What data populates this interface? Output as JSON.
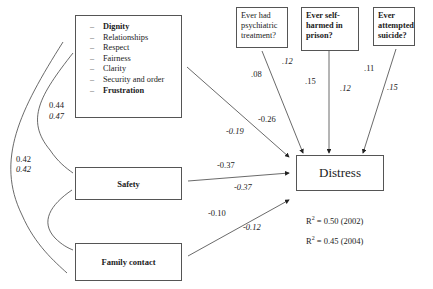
{
  "diagram": {
    "type": "path model",
    "factors_box": {
      "items": [
        {
          "label": "Dignity",
          "bold": true
        },
        {
          "label": "Relationships",
          "bold": false
        },
        {
          "label": "Respect",
          "bold": false
        },
        {
          "label": "Fairness",
          "bold": false
        },
        {
          "label": "Clarity",
          "bold": false
        },
        {
          "label": "Security and order",
          "bold": false
        },
        {
          "label": "Frustration",
          "bold": true
        }
      ],
      "bullet": "–"
    },
    "nodes": {
      "safety": "Safety",
      "family_contact": "Family contact",
      "distress": "Distress"
    },
    "questions": [
      {
        "label": "Ever had psychiatric treatment?",
        "lines": [
          "Ever had",
          "psychiatric",
          "treatment?"
        ]
      },
      {
        "label": "Ever self-harmed in prison?",
        "lines": [
          "Ever self-",
          "harmed in",
          "prison?"
        ]
      },
      {
        "label": "Ever attempted suicide?",
        "lines": [
          "Ever",
          "attempted",
          "suicide?"
        ]
      }
    ],
    "coefficients": {
      "factors_distress": {
        "y2002": "-0.26",
        "y2004": "-0.19"
      },
      "safety_distress": {
        "y2002": "-0.37",
        "y2004": "-0.37"
      },
      "family_distress": {
        "y2002": "-0.10",
        "y2004": "-0.12"
      },
      "psychiatric_distress": {
        "y2002": ".08",
        "y2004": ".12"
      },
      "selfharm_distress": {
        "y2002": ".15",
        "y2004": ".12"
      },
      "suicide_distress": {
        "y2002": ".11",
        "y2004": ".15"
      },
      "factors_safety_corr": {
        "y2002": "0.44",
        "y2004": "0.47"
      },
      "factors_family_corr": {
        "y2002": "0.42",
        "y2004": "0.42"
      }
    },
    "r_squared": [
      {
        "prefix": "R",
        "sup": "2",
        "text": " = 0.50 (2002)"
      },
      {
        "prefix": "R",
        "sup": "2",
        "text": " = 0.45 (2004)"
      }
    ],
    "colors": {
      "line": "#333333",
      "border": "#555555",
      "text": "#222222"
    }
  }
}
